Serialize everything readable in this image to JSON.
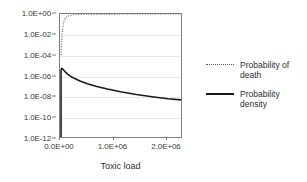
{
  "chart_data": {
    "type": "line",
    "title": "",
    "xlabel": "Toxic load",
    "ylabel": "",
    "xlim": [
      0,
      2300000
    ],
    "ylim": [
      1e-12,
      1
    ],
    "yscale": "log",
    "grid": true,
    "legend_position": "right",
    "x_ticks": [
      {
        "value": 0,
        "label": "0.0E+00"
      },
      {
        "value": 1000000,
        "label": "1.0E+06"
      },
      {
        "value": 2000000,
        "label": "2.0E+06"
      }
    ],
    "y_ticks": [
      {
        "value": 1.0,
        "label": "1.0E+00"
      },
      {
        "value": 0.01,
        "label": "1.0E-02"
      },
      {
        "value": 0.0001,
        "label": "1.0E-04"
      },
      {
        "value": 1e-06,
        "label": "1.0E-06"
      },
      {
        "value": 1e-08,
        "label": "1.0E-08"
      },
      {
        "value": 1e-10,
        "label": "1.0E-10"
      },
      {
        "value": 1e-12,
        "label": "1.0E-12"
      }
    ],
    "series": [
      {
        "name": "Probability of death",
        "style": "dotted",
        "color": "#555555",
        "x": [
          20000,
          30000,
          40000,
          55000,
          70000,
          90000,
          110000,
          140000,
          180000,
          230000,
          300000,
          400000,
          520000,
          680000,
          880000,
          1100000,
          1400000,
          1700000,
          2000000,
          2300000
        ],
        "y": [
          0.0001,
          0.002,
          0.012,
          0.06,
          0.15,
          0.3,
          0.45,
          0.6,
          0.72,
          0.82,
          0.88,
          0.92,
          0.95,
          0.965,
          0.975,
          0.982,
          0.988,
          0.991,
          0.993,
          0.995
        ]
      },
      {
        "name": "Probability density",
        "style": "solid",
        "color": "#1a1a1a",
        "x": [
          20000,
          20000,
          30000,
          45000,
          60000,
          80000,
          110000,
          150000,
          200000,
          280000,
          380000,
          520000,
          700000,
          900000,
          1150000,
          1450000,
          1750000,
          2050000,
          2300000
        ],
        "y": [
          1e-12,
          3e-06,
          5e-06,
          4.6e-06,
          3.8e-06,
          2.9e-06,
          2e-06,
          1.3e-06,
          8.5e-07,
          5e-07,
          2.9e-07,
          1.6e-07,
          8.5e-08,
          4.8e-08,
          2.6e-08,
          1.4e-08,
          8.5e-09,
          5.5e-09,
          4.2e-09
        ]
      }
    ]
  },
  "legend": {
    "entries": [
      {
        "line1": "Probability of",
        "line2": "death"
      },
      {
        "line1": "Probability",
        "line2": "density"
      }
    ]
  },
  "colors": {
    "axis": "#7f7f7f",
    "grid": "#e8e8e8",
    "text": "#2e2e2e",
    "series_death": "#555555",
    "series_density": "#1a1a1a"
  }
}
